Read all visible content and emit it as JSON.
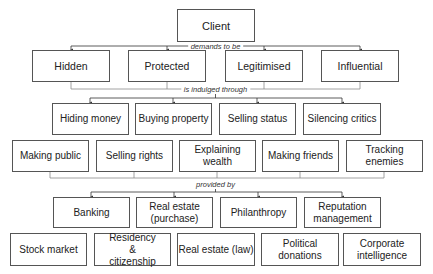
{
  "diagram": {
    "root": {
      "label": "Client"
    },
    "connectors": {
      "demands": "demands to be",
      "indulged": "is indulged through",
      "provided": "provided by"
    },
    "demands": [
      {
        "label": "Hidden"
      },
      {
        "label": "Protected"
      },
      {
        "label": "Legitimised"
      },
      {
        "label": "Influential"
      }
    ],
    "activities_row1": [
      {
        "label": "Hiding money"
      },
      {
        "label": "Buying property"
      },
      {
        "label": "Selling status"
      },
      {
        "label": "Silencing critics"
      }
    ],
    "activities_row2": [
      {
        "label": "Making public"
      },
      {
        "label": "Selling rights"
      },
      {
        "label": "Explaining wealth"
      },
      {
        "label": "Making friends"
      },
      {
        "label": "Tracking enemies"
      }
    ],
    "providers_row1": [
      {
        "label": "Banking"
      },
      {
        "label": "Real estate (purchase)"
      },
      {
        "label": "Philanthropy"
      },
      {
        "label": "Reputation management"
      }
    ],
    "providers_row2": [
      {
        "label": "Stock market"
      },
      {
        "label": "Residency & citizenship"
      },
      {
        "label": "Real estate (law)"
      },
      {
        "label": "Political donations"
      },
      {
        "label": "Corporate intelligence"
      }
    ],
    "colors": {
      "line": "#555555",
      "box_border": "#555555",
      "connector_gray": "#8a8a8a"
    }
  }
}
